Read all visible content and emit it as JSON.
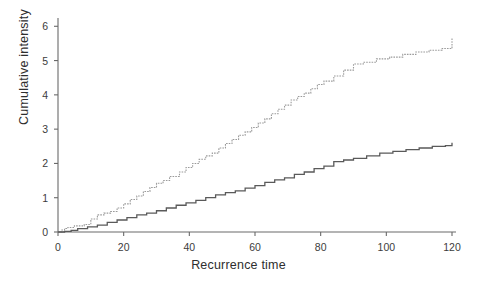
{
  "chart_data": {
    "type": "line",
    "title": "",
    "subtitle": "",
    "xlabel": "Recurrence time",
    "ylabel": "Cumulative intensity",
    "xlim": [
      0,
      122
    ],
    "ylim": [
      0,
      6.3
    ],
    "xticks": [
      0,
      20,
      40,
      60,
      80,
      100,
      120
    ],
    "xtick_labels": [
      "0",
      "20",
      "40",
      "60",
      "80",
      "100",
      "120"
    ],
    "yticks": [
      0,
      1,
      2,
      3,
      4,
      5,
      6
    ],
    "ytick_labels": [
      "0",
      "1",
      "2",
      "3",
      "4",
      "5",
      "6"
    ],
    "grid": false,
    "legend": "none",
    "drawstyle": "steps-post",
    "series": [
      {
        "name": "upper-cumulative-intensity",
        "style": "dotted",
        "color": "#9a9a9a",
        "linewidth": 1.1,
        "x": [
          0,
          1,
          2,
          3,
          5,
          8,
          10,
          12,
          14,
          16,
          18,
          20,
          22,
          24,
          26,
          28,
          30,
          32,
          34,
          37,
          39,
          41,
          43,
          45,
          47,
          49,
          51,
          53,
          55,
          57,
          59,
          61,
          63,
          65,
          67,
          69,
          71,
          73,
          75,
          77,
          79,
          81,
          84,
          87,
          90,
          93,
          97,
          101,
          105,
          109,
          113,
          117,
          120,
          120
        ],
        "y": [
          0.0,
          0.06,
          0.1,
          0.13,
          0.18,
          0.22,
          0.38,
          0.5,
          0.55,
          0.6,
          0.7,
          0.82,
          0.95,
          1.05,
          1.18,
          1.3,
          1.42,
          1.5,
          1.62,
          1.75,
          1.88,
          2.0,
          2.12,
          2.22,
          2.3,
          2.45,
          2.58,
          2.7,
          2.82,
          2.92,
          3.05,
          3.18,
          3.3,
          3.45,
          3.58,
          3.7,
          3.85,
          3.95,
          4.05,
          4.18,
          4.3,
          4.4,
          4.55,
          4.72,
          4.9,
          4.95,
          5.05,
          5.1,
          5.18,
          5.25,
          5.3,
          5.35,
          5.38,
          5.65
        ]
      },
      {
        "name": "lower-cumulative-intensity",
        "style": "solid",
        "color": "#5a5a5a",
        "linewidth": 1.3,
        "x": [
          0,
          2,
          4,
          6,
          9,
          12,
          15,
          18,
          21,
          24,
          27,
          30,
          33,
          36,
          39,
          42,
          45,
          48,
          51,
          54,
          57,
          60,
          63,
          66,
          69,
          72,
          75,
          78,
          81,
          84,
          87,
          90,
          94,
          98,
          102,
          106,
          110,
          114,
          118,
          120,
          120
        ],
        "y": [
          0.0,
          0.02,
          0.05,
          0.1,
          0.15,
          0.2,
          0.28,
          0.35,
          0.42,
          0.5,
          0.55,
          0.62,
          0.7,
          0.78,
          0.85,
          0.92,
          1.0,
          1.08,
          1.15,
          1.2,
          1.28,
          1.35,
          1.45,
          1.52,
          1.58,
          1.68,
          1.75,
          1.85,
          1.92,
          2.05,
          2.1,
          2.15,
          2.22,
          2.3,
          2.35,
          2.4,
          2.45,
          2.5,
          2.52,
          2.55,
          2.6
        ]
      }
    ]
  },
  "axes": {
    "y_axis_name": "cumulative-intensity-axis",
    "x_axis_name": "recurrence-time-axis"
  }
}
